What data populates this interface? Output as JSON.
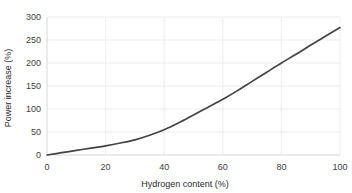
{
  "chart_data": {
    "type": "line",
    "title": "",
    "subtitle": "",
    "xlabel": "Hydrogen content (%)",
    "ylabel": "Power increase (%)",
    "xlim": [
      0,
      100
    ],
    "ylim": [
      0,
      300
    ],
    "xticks": [
      0,
      20,
      40,
      60,
      80,
      100
    ],
    "xtick_labels": [
      "0",
      "20",
      "40",
      "60",
      "80",
      "100"
    ],
    "yticks": [
      0,
      50,
      100,
      150,
      200,
      250,
      300
    ],
    "ytick_labels": [
      "0",
      "50",
      "100",
      "150",
      "200",
      "250",
      "300"
    ],
    "grid": true,
    "legend": false,
    "legend_position": "none",
    "annotations": [],
    "series": [
      {
        "name": "Power increase",
        "color": "#434343",
        "x": [
          0,
          5,
          10,
          15,
          20,
          25,
          30,
          35,
          40,
          45,
          50,
          55,
          60,
          65,
          70,
          75,
          80,
          85,
          90,
          95,
          100
        ],
        "values": [
          0,
          5,
          10,
          15,
          20,
          26,
          33,
          43,
          55,
          70,
          87,
          104,
          121,
          140,
          160,
          180,
          200,
          219,
          239,
          258,
          277
        ]
      }
    ]
  },
  "colors": {
    "line": "#434343",
    "grid": "#e9e9e9",
    "axis": "#d8d8d8",
    "tick_label": "#3d3d3d",
    "axis_title": "#2b2b2b",
    "background": "#ffffff"
  }
}
